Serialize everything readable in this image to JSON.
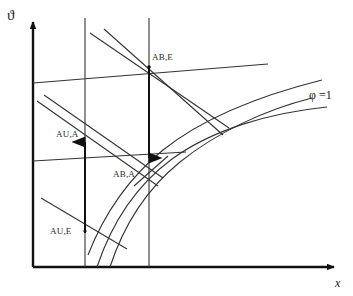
{
  "figure": {
    "kind": "mollier-h-x-diagram",
    "background_color": "#ffffff",
    "line_color": "#333333",
    "axis_color": "#111111",
    "text_color": "#2b2b2b"
  },
  "axes": {
    "y_label": "ϑ",
    "x_label": "x",
    "y_label_pos": {
      "x": 9,
      "y": 10
    },
    "x_label_pos": {
      "x": 335,
      "y": 277
    },
    "origin": {
      "x": 33,
      "y": 267
    },
    "y_top": {
      "x": 33,
      "y": 16
    },
    "x_right": {
      "x": 340,
      "y": 267
    }
  },
  "curves": {
    "saturation_label": "φ =1",
    "saturation_label_pos": {
      "x": 310,
      "y": 89
    },
    "saturation_path": "M 97,267 C 112,222 137,185 172,159 C 212,130 268,113 327,107",
    "enthalpy_curve_upper": "M 88,255 C 106,212 132,175 166,148 C 206,117 262,96 325,84",
    "fog_curve_left": "M 110,267 C 124,224 148,188 180,162 C 216,133 264,110 310,97"
  },
  "process_points": [
    {
      "name": "AB,E",
      "label": "AB,E",
      "label_pos": {
        "x": 152,
        "y": 54
      },
      "point": {
        "x": 149,
        "y": 67
      }
    },
    {
      "name": "AU,A",
      "label": "AU,A",
      "label_pos": {
        "x": 56,
        "y": 130
      },
      "point": {
        "x": 85,
        "y": 139
      }
    },
    {
      "name": "AB,A",
      "label": "AB,A",
      "label_pos": {
        "x": 114,
        "y": 170
      },
      "point": {
        "x": 149,
        "y": 161
      }
    },
    {
      "name": "AU,E",
      "label": "AU,E",
      "label_pos": {
        "x": 50,
        "y": 228
      },
      "point": {
        "x": 85,
        "y": 230
      }
    }
  ],
  "vertical_lines": [
    {
      "name": "left-vertical-constant-x",
      "x": 85,
      "y_top": 18,
      "y_bottom": 267
    },
    {
      "name": "right-vertical-constant-x",
      "x": 149,
      "y_top": 18,
      "y_bottom": 267
    }
  ],
  "arrows": [
    {
      "name": "up-arrow-AU-E-to-AU-A",
      "x": 85,
      "y_start": 232,
      "y_end": 137,
      "direction": "up"
    },
    {
      "name": "down-arrow-AB-E-to-AB-A",
      "x": 149,
      "y_start": 67,
      "y_end": 163,
      "direction": "down"
    }
  ],
  "isotherms": [
    {
      "name": "isotherm-upper",
      "x1": 33,
      "y1": 83,
      "x2": 268,
      "y2": 65
    },
    {
      "name": "isotherm-lower",
      "x1": 33,
      "y1": 160,
      "x2": 184,
      "y2": 152
    }
  ],
  "mixing_lines": [
    {
      "name": "mixing-line-1",
      "x1": 90,
      "y1": 33,
      "x2": 228,
      "y2": 127
    },
    {
      "name": "mixing-line-2",
      "x1": 44,
      "y1": 96,
      "x2": 160,
      "y2": 177
    },
    {
      "name": "mixing-line-3",
      "x1": 37,
      "y1": 101,
      "x2": 156,
      "y2": 184
    },
    {
      "name": "mixing-line-4",
      "x1": 41,
      "y1": 198,
      "x2": 125,
      "y2": 248
    },
    {
      "name": "enthalpy-line-through-AB-E",
      "x1": 221,
      "y1": 134,
      "x2": 103,
      "y2": 29
    }
  ]
}
